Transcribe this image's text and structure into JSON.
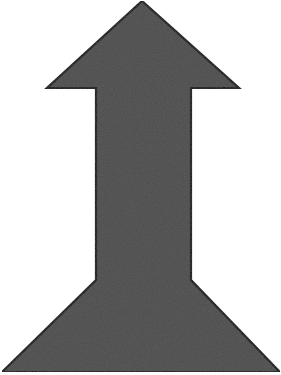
{
  "figure": {
    "subject": "upward arrow with flared base",
    "icon": "arrow-up-icon",
    "colors": {
      "background": "#ffffff",
      "fill": "#4b4b4b",
      "outline": "#0a0a0a"
    }
  }
}
